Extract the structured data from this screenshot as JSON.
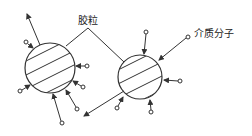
{
  "diagram": {
    "labels": {
      "particle": "胶粒",
      "medium_molecule": "介质分子"
    },
    "colors": {
      "stroke": "#333333",
      "background": "#ffffff"
    },
    "particles": [
      {
        "id": "left",
        "cx": 50,
        "cy": 68,
        "r": 25
      },
      {
        "id": "right",
        "cx": 140,
        "cy": 77,
        "r": 22
      }
    ]
  }
}
